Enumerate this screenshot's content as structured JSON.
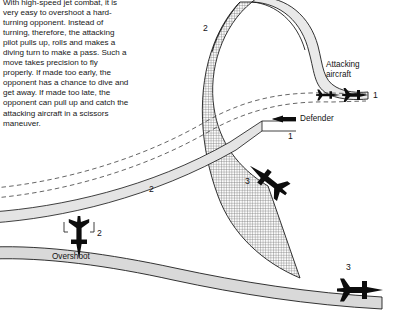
{
  "figure": {
    "domain_note": "air combat maneuver diagram",
    "section_title": "THE HIGH-SPEED YO-YO",
    "body_text": "With high-speed jet combat, it is very easy to overshoot a hard-turning opponent. Instead of turning, therefore, the attacking pilot pulls up, rolls and makes a diving turn to make a pass. Such a move takes precision to fly properly. If made too early, the opponent has a chance to dive and get away. If made too late, the opponent can pull up and catch the attacking aircraft in a scissors maneuver.",
    "labels": {
      "attacking_aircraft": "Attacking\naircraft",
      "attacking_aircraft_line1": "Attacking",
      "attacking_aircraft_line2": "aircraft",
      "defender": "Defender",
      "overshoot": "Overshoot"
    },
    "markers": {
      "attacker_1": "1",
      "attacker_2": "2",
      "attacker_3": "3",
      "defender_1": "1",
      "defender_2": "2",
      "defender_3": "3"
    },
    "colors": {
      "ink": "#131313",
      "band_fill_plain": "#d8d8d8",
      "band_fill_hatched": "#efefef",
      "hatch_stroke": "#6f6f6f",
      "outline": "#111111",
      "dashed": "#555555",
      "page_background": "#ffffff"
    }
  }
}
